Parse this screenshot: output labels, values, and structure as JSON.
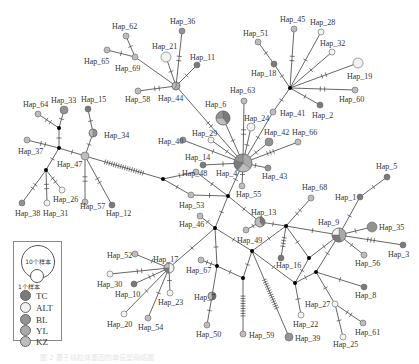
{
  "legend": {
    "size_large": "10个样本",
    "size_small": "1个样本",
    "populations": [
      {
        "label": "TC",
        "color": "#7a7a7a"
      },
      {
        "label": "ALT",
        "color": "#f2f2f2"
      },
      {
        "label": "BL",
        "color": "#939393"
      },
      {
        "label": "YL",
        "color": "#aaaaaa"
      },
      {
        "label": "KZ",
        "color": "#bdbdbd"
      }
    ]
  },
  "colors": {
    "TC": "#7a7a7a",
    "ALT": "#f2f2f2",
    "BL": "#939393",
    "YL": "#aaaaaa",
    "KZ": "#bdbdbd",
    "median": "#000000"
  },
  "nodes": [
    {
      "id": "Hap_4",
      "x": 243,
      "y": 163,
      "r": 9,
      "pie": [
        [
          "YL",
          0.35
        ],
        [
          "KZ",
          0.25
        ],
        [
          "TC",
          0.2
        ],
        [
          "BL",
          0.2
        ]
      ],
      "lx": 216,
      "ly": 176
    },
    {
      "id": "Hap_6",
      "x": 223,
      "y": 118,
      "r": 7,
      "pie": [
        [
          "TC",
          0.4
        ],
        [
          "KZ",
          0.35
        ],
        [
          "BL",
          0.25
        ]
      ],
      "lx": 205,
      "ly": 107
    },
    {
      "id": "Hap_63",
      "x": 244,
      "y": 101,
      "r": 3,
      "c": "KZ",
      "lx": 230,
      "ly": 93
    },
    {
      "id": "Hap_24",
      "x": 251,
      "y": 127,
      "r": 4,
      "c": "ALT",
      "lx": 244,
      "ly": 121
    },
    {
      "id": "Hap_42",
      "x": 269,
      "y": 142,
      "r": 4,
      "c": "BL",
      "lx": 264,
      "ly": 135
    },
    {
      "id": "Hap_66",
      "x": 298,
      "y": 142,
      "r": 3,
      "c": "KZ",
      "lx": 292,
      "ly": 135
    },
    {
      "id": "Hap_43",
      "x": 268,
      "y": 168,
      "r": 3,
      "c": "BL",
      "lx": 262,
      "ly": 179
    },
    {
      "id": "Hap_55",
      "x": 242,
      "y": 186,
      "r": 3,
      "c": "KZ",
      "lx": 236,
      "ly": 197
    },
    {
      "id": "Hap_29",
      "x": 211,
      "y": 140,
      "r": 3,
      "c": "ALT",
      "lx": 192,
      "ly": 136
    },
    {
      "id": "Hap_40",
      "x": 183,
      "y": 140,
      "r": 3,
      "c": "BL",
      "lx": 158,
      "ly": 144
    },
    {
      "id": "Hap_14",
      "x": 203,
      "y": 165,
      "r": 3,
      "c": "TC",
      "lx": 185,
      "ly": 160
    },
    {
      "id": "Hap_48",
      "x": 196,
      "y": 172,
      "r": 3,
      "c": "KZ",
      "lx": 182,
      "ly": 176
    },
    {
      "id": "Hap_44",
      "x": 176,
      "y": 86,
      "r": 4,
      "pie": [
        [
          "YL",
          0.6
        ],
        [
          "KZ",
          0.4
        ]
      ],
      "lx": 158,
      "ly": 101
    },
    {
      "id": "Hap_21",
      "x": 166,
      "y": 57,
      "r": 5,
      "c": "ALT",
      "lx": 152,
      "ly": 49
    },
    {
      "id": "Hap_36",
      "x": 182,
      "y": 31,
      "r": 3,
      "c": "BL",
      "lx": 170,
      "ly": 24
    },
    {
      "id": "Hap_11",
      "x": 197,
      "y": 65,
      "r": 3,
      "c": "TC",
      "lx": 190,
      "ly": 60
    },
    {
      "id": "Hap_69",
      "x": 135,
      "y": 57,
      "r": 3,
      "c": "KZ",
      "lx": 115,
      "ly": 71
    },
    {
      "id": "Hap_62",
      "x": 126,
      "y": 36,
      "r": 3,
      "c": "KZ",
      "lx": 112,
      "ly": 29
    },
    {
      "id": "Hap_65",
      "x": 107,
      "y": 50,
      "r": 3,
      "c": "KZ",
      "lx": 84,
      "ly": 64
    },
    {
      "id": "Hap_58",
      "x": 138,
      "y": 91,
      "r": 3,
      "c": "KZ",
      "lx": 125,
      "ly": 102
    },
    {
      "id": "Hap_18",
      "x": 274,
      "y": 64,
      "r": 3,
      "c": "TC",
      "lx": 251,
      "ly": 76
    },
    {
      "id": "Hap_51",
      "x": 258,
      "y": 42,
      "r": 3,
      "c": "KZ",
      "lx": 243,
      "ly": 36
    },
    {
      "id": "Hap_45",
      "x": 294,
      "y": 29,
      "r": 3,
      "c": "KZ",
      "lx": 280,
      "ly": 22
    },
    {
      "id": "Hap_28",
      "x": 321,
      "y": 32,
      "r": 3,
      "c": "ALT",
      "lx": 310,
      "ly": 25
    },
    {
      "id": "Hap_32",
      "x": 332,
      "y": 52,
      "r": 3,
      "c": "ALT",
      "lx": 320,
      "ly": 46
    },
    {
      "id": "Hap_19",
      "x": 358,
      "y": 63,
      "r": 5,
      "c": "ALT",
      "lx": 347,
      "ly": 79
    },
    {
      "id": "Hap_60",
      "x": 355,
      "y": 90,
      "r": 3,
      "c": "KZ",
      "lx": 339,
      "ly": 102
    },
    {
      "id": "Hap_2",
      "x": 320,
      "y": 105,
      "r": 3,
      "c": "TC",
      "lx": 312,
      "ly": 118
    },
    {
      "id": "Hap_41",
      "x": 273,
      "y": 112,
      "r": 3,
      "c": "KZ",
      "lx": 280,
      "ly": 116
    },
    {
      "id": "Hap_33",
      "x": 64,
      "y": 110,
      "r": 4,
      "c": "BL",
      "lx": 51,
      "ly": 103
    },
    {
      "id": "Hap_64",
      "x": 38,
      "y": 114,
      "r": 3,
      "c": "KZ",
      "lx": 23,
      "ly": 107
    },
    {
      "id": "Hap_15",
      "x": 88,
      "y": 109,
      "r": 3,
      "c": "TC",
      "lx": 81,
      "ly": 102
    },
    {
      "id": "Hap_34",
      "x": 93,
      "y": 133,
      "r": 4,
      "pie": [
        [
          "BL",
          0.5
        ],
        [
          "KZ",
          0.5
        ]
      ],
      "lx": 104,
      "ly": 138
    },
    {
      "id": "Hap_37",
      "x": 27,
      "y": 140,
      "r": 3,
      "c": "KZ",
      "lx": 18,
      "ly": 154
    },
    {
      "id": "Hap_47",
      "x": 85,
      "y": 156,
      "r": 4,
      "c": "KZ",
      "lx": 57,
      "ly": 167
    },
    {
      "id": "Hap_38",
      "x": 22,
      "y": 203,
      "r": 3,
      "c": "BL",
      "lx": 15,
      "ly": 216
    },
    {
      "id": "Hap_31",
      "x": 47,
      "y": 203,
      "r": 3,
      "c": "ALT",
      "lx": 43,
      "ly": 216
    },
    {
      "id": "Hap_26",
      "x": 62,
      "y": 190,
      "r": 3,
      "c": "ALT",
      "lx": 53,
      "ly": 202
    },
    {
      "id": "Hap_57",
      "x": 85,
      "y": 202,
      "r": 3,
      "c": "KZ",
      "lx": 80,
      "ly": 209
    },
    {
      "id": "Hap_12",
      "x": 112,
      "y": 205,
      "r": 3,
      "c": "TC",
      "lx": 106,
      "ly": 216
    },
    {
      "id": "Hap_53",
      "x": 191,
      "y": 195,
      "r": 3,
      "c": "KZ",
      "lx": 179,
      "ly": 208
    },
    {
      "id": "Hap_46",
      "x": 200,
      "y": 216,
      "r": 3,
      "c": "KZ",
      "lx": 179,
      "ly": 227
    },
    {
      "id": "Hap_13",
      "x": 260,
      "y": 222,
      "r": 5,
      "pie": [
        [
          "TC",
          0.4
        ],
        [
          "KZ",
          0.6
        ]
      ],
      "lx": 251,
      "ly": 215
    },
    {
      "id": "Hap_13b",
      "x": 246,
      "y": 230,
      "r": 3,
      "c": "KZ",
      "nolabel": true
    },
    {
      "id": "Hap_17",
      "x": 169,
      "y": 268,
      "r": 5,
      "pie": [
        [
          "ALT",
          0.5
        ],
        [
          "TC",
          0.25
        ],
        [
          "KZ",
          0.25
        ]
      ],
      "lx": 153,
      "ly": 262
    },
    {
      "id": "Hap_52",
      "x": 135,
      "y": 254,
      "r": 3,
      "c": "KZ",
      "lx": 107,
      "ly": 258
    },
    {
      "id": "Hap_30",
      "x": 110,
      "y": 274,
      "r": 3,
      "c": "ALT",
      "lx": 97,
      "ly": 287
    },
    {
      "id": "Hap_10",
      "x": 134,
      "y": 284,
      "r": 3,
      "c": "TC",
      "lx": 115,
      "ly": 297
    },
    {
      "id": "Hap_23",
      "x": 170,
      "y": 293,
      "r": 3,
      "c": "ALT",
      "lx": 158,
      "ly": 305
    },
    {
      "id": "Hap_20",
      "x": 124,
      "y": 314,
      "r": 3,
      "c": "ALT",
      "lx": 107,
      "ly": 327
    },
    {
      "id": "Hap_54",
      "x": 148,
      "y": 318,
      "r": 3,
      "c": "KZ",
      "lx": 138,
      "ly": 330
    },
    {
      "id": "Hap_67",
      "x": 201,
      "y": 260,
      "r": 3,
      "c": "KZ",
      "lx": 186,
      "ly": 273
    },
    {
      "id": "Hap_7",
      "x": 212,
      "y": 296,
      "r": 4,
      "pie": [
        [
          "TC",
          0.5
        ],
        [
          "KZ",
          0.5
        ]
      ],
      "lx": 194,
      "ly": 300
    },
    {
      "id": "Hap_50",
      "x": 207,
      "y": 325,
      "r": 3,
      "c": "KZ",
      "lx": 196,
      "ly": 337
    },
    {
      "id": "Hap_59",
      "x": 243,
      "y": 334,
      "r": 3,
      "c": "KZ",
      "lx": 249,
      "ly": 338
    },
    {
      "id": "Hap_39",
      "x": 289,
      "y": 337,
      "r": 4,
      "c": "BL",
      "lx": 295,
      "ly": 341
    },
    {
      "id": "Hap_68",
      "x": 311,
      "y": 198,
      "r": 3,
      "c": "KZ",
      "lx": 302,
      "ly": 190
    },
    {
      "id": "Hap_16",
      "x": 281,
      "y": 258,
      "r": 3,
      "c": "TC",
      "lx": 276,
      "ly": 268
    },
    {
      "id": "Hap_49",
      "x": 258,
      "y": 250,
      "r": 0,
      "c": "KZ",
      "lx": 237,
      "ly": 243,
      "nolabel_node": true
    },
    {
      "id": "Hap_22",
      "x": 301,
      "y": 315,
      "r": 3,
      "c": "ALT",
      "lx": 293,
      "ly": 327
    },
    {
      "id": "Hap_27",
      "x": 335,
      "y": 304,
      "r": 3,
      "c": "ALT",
      "lx": 305,
      "ly": 307
    },
    {
      "id": "Hap_25",
      "x": 343,
      "y": 337,
      "r": 3,
      "c": "ALT",
      "lx": 333,
      "ly": 347
    },
    {
      "id": "Hap_61",
      "x": 363,
      "y": 323,
      "r": 3,
      "c": "KZ",
      "lx": 355,
      "ly": 335
    },
    {
      "id": "Hap_8",
      "x": 364,
      "y": 287,
      "r": 3,
      "c": "TC",
      "lx": 355,
      "ly": 298
    },
    {
      "id": "Hap_9",
      "x": 339,
      "y": 235,
      "r": 7,
      "pie": [
        [
          "YL",
          0.45
        ],
        [
          "TC",
          0.3
        ],
        [
          "ALT",
          0.25
        ]
      ],
      "lx": 318,
      "ly": 225
    },
    {
      "id": "Hap_35",
      "x": 372,
      "y": 227,
      "r": 5,
      "c": "BL",
      "lx": 379,
      "ly": 230
    },
    {
      "id": "Hap_3",
      "x": 403,
      "y": 245,
      "r": 3,
      "c": "TC",
      "lx": 388,
      "ly": 257
    },
    {
      "id": "Hap_56",
      "x": 364,
      "y": 255,
      "r": 3,
      "c": "KZ",
      "lx": 355,
      "ly": 266
    },
    {
      "id": "Hap_1",
      "x": 360,
      "y": 197,
      "r": 3,
      "c": "TC",
      "lx": 335,
      "ly": 200
    },
    {
      "id": "Hap_5",
      "x": 387,
      "y": 177,
      "r": 3,
      "c": "TC",
      "lx": 376,
      "ly": 169
    }
  ],
  "medians": [
    {
      "id": "m1",
      "x": 290,
      "y": 88
    },
    {
      "id": "m2",
      "x": 59,
      "y": 128
    },
    {
      "id": "m3",
      "x": 59,
      "y": 148
    },
    {
      "id": "m4",
      "x": 46,
      "y": 170
    },
    {
      "id": "m5",
      "x": 163,
      "y": 179
    },
    {
      "id": "m6",
      "x": 228,
      "y": 196
    },
    {
      "id": "m7",
      "x": 215,
      "y": 228
    },
    {
      "id": "m8",
      "x": 286,
      "y": 226
    },
    {
      "id": "m9",
      "x": 252,
      "y": 251
    },
    {
      "id": "m10",
      "x": 217,
      "y": 266
    },
    {
      "id": "m11",
      "x": 243,
      "y": 278
    },
    {
      "id": "m12",
      "x": 309,
      "y": 258
    },
    {
      "id": "m13",
      "x": 316,
      "y": 272
    },
    {
      "id": "m14",
      "x": 295,
      "y": 283
    }
  ],
  "edges": [
    [
      "Hap_4",
      "Hap_6",
      1
    ],
    [
      "Hap_4",
      "Hap_63",
      2
    ],
    [
      "Hap_4",
      "Hap_24",
      1
    ],
    [
      "Hap_4",
      "Hap_42",
      1
    ],
    [
      "Hap_4",
      "Hap_66",
      3
    ],
    [
      "Hap_4",
      "Hap_43",
      1
    ],
    [
      "Hap_4",
      "Hap_55",
      1
    ],
    [
      "Hap_4",
      "Hap_29",
      1
    ],
    [
      "Hap_4",
      "Hap_40",
      1
    ],
    [
      "Hap_4",
      "Hap_14",
      1
    ],
    [
      "Hap_4",
      "Hap_44",
      2
    ],
    [
      "Hap_4",
      "Hap_41",
      1
    ],
    [
      "Hap_41",
      "m1",
      1
    ],
    [
      "m1",
      "Hap_18",
      1
    ],
    [
      "Hap_18",
      "Hap_51",
      1
    ],
    [
      "m1",
      "Hap_45",
      2
    ],
    [
      "m1",
      "Hap_28",
      1
    ],
    [
      "m1",
      "Hap_32",
      1
    ],
    [
      "m1",
      "Hap_19",
      2
    ],
    [
      "m1",
      "Hap_60",
      2
    ],
    [
      "m1",
      "Hap_2",
      1
    ],
    [
      "Hap_44",
      "Hap_21",
      1
    ],
    [
      "Hap_44",
      "Hap_36",
      2
    ],
    [
      "Hap_44",
      "Hap_11",
      1
    ],
    [
      "Hap_44",
      "Hap_69",
      0
    ],
    [
      "Hap_69",
      "Hap_62",
      1
    ],
    [
      "Hap_69",
      "Hap_65",
      1
    ],
    [
      "Hap_44",
      "Hap_58",
      2
    ],
    [
      "Hap_47",
      "m5",
      18
    ],
    [
      "m5",
      "Hap_48",
      1
    ],
    [
      "m5",
      "Hap_53",
      1
    ],
    [
      "Hap_48",
      "m6",
      1
    ],
    [
      "Hap_53",
      "m6",
      1
    ],
    [
      "Hap_4",
      "m6",
      1
    ],
    [
      "Hap_47",
      "Hap_34",
      1
    ],
    [
      "Hap_34",
      "Hap_15",
      1
    ],
    [
      "Hap_47",
      "m3",
      1
    ],
    [
      "m3",
      "m2",
      1
    ],
    [
      "m2",
      "Hap_33",
      1
    ],
    [
      "m2",
      "Hap_64",
      2
    ],
    [
      "m3",
      "Hap_37",
      2
    ],
    [
      "m3",
      "m4",
      1
    ],
    [
      "m4",
      "Hap_38",
      2
    ],
    [
      "m4",
      "Hap_31",
      2
    ],
    [
      "m4",
      "Hap_26",
      2
    ],
    [
      "Hap_47",
      "Hap_57",
      2
    ],
    [
      "Hap_47",
      "Hap_12",
      2
    ],
    [
      "m6",
      "Hap_13",
      1
    ],
    [
      "Hap_13",
      "m8",
      1
    ],
    [
      "Hap_13",
      "Hap_13b",
      1
    ],
    [
      "m6",
      "m7",
      1
    ],
    [
      "Hap_46",
      "m7",
      1
    ],
    [
      "m7",
      "Hap_17",
      1
    ],
    [
      "m7",
      "m9",
      1
    ],
    [
      "m7",
      "m10",
      1
    ],
    [
      "m10",
      "Hap_67",
      2
    ],
    [
      "m10",
      "Hap_7",
      0
    ],
    [
      "m10",
      "m11",
      1
    ],
    [
      "Hap_7",
      "Hap_50",
      1
    ],
    [
      "Hap_17",
      "Hap_52",
      1
    ],
    [
      "Hap_17",
      "Hap_30",
      2
    ],
    [
      "Hap_17",
      "Hap_10",
      2
    ],
    [
      "Hap_17",
      "Hap_23",
      1
    ],
    [
      "Hap_17",
      "Hap_20",
      1
    ],
    [
      "Hap_17",
      "Hap_54",
      1
    ],
    [
      "m9",
      "m11",
      1
    ],
    [
      "m11",
      "Hap_59",
      9
    ],
    [
      "m9",
      "Hap_39",
      14
    ],
    [
      "m9",
      "m8",
      1
    ],
    [
      "m8",
      "Hap_16",
      4
    ],
    [
      "m8",
      "Hap_68",
      2
    ],
    [
      "m8",
      "Hap_9",
      1
    ],
    [
      "m8",
      "m12",
      1
    ],
    [
      "m9",
      "m14",
      1
    ],
    [
      "m12",
      "m14",
      1
    ],
    [
      "m12",
      "Hap_9",
      1
    ],
    [
      "m13",
      "Hap_9",
      1
    ],
    [
      "m14",
      "m13",
      1
    ],
    [
      "m13",
      "Hap_8",
      1
    ],
    [
      "m13",
      "Hap_27",
      1
    ],
    [
      "m14",
      "Hap_22",
      1
    ],
    [
      "Hap_27",
      "Hap_61",
      2
    ],
    [
      "Hap_27",
      "Hap_25",
      1
    ],
    [
      "Hap_9",
      "Hap_1",
      1
    ],
    [
      "Hap_1",
      "Hap_5",
      1
    ],
    [
      "Hap_9",
      "Hap_35",
      1
    ],
    [
      "Hap_9",
      "Hap_3",
      3
    ],
    [
      "Hap_9",
      "Hap_56",
      1
    ]
  ],
  "caption": "图 2 基于线粒体基因的单倍型网络图"
}
